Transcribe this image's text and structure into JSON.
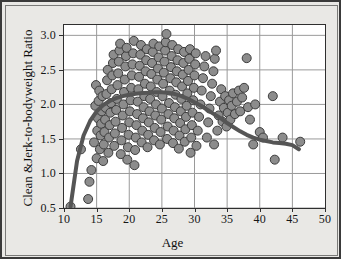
{
  "chart_data": {
    "type": "scatter",
    "title": "",
    "xlabel": "Age",
    "ylabel": "Clean &Jerk-to-bodyweight Ratio",
    "xlim": [
      10,
      50
    ],
    "ylim": [
      0.5,
      3.15
    ],
    "xticks": [
      "10",
      "15",
      "20",
      "25",
      "30",
      "35",
      "40",
      "45",
      "50"
    ],
    "yticks": [
      "0.5",
      "1.0",
      "1.5",
      "2.0",
      "2.5",
      "3.0"
    ],
    "grid": true,
    "legend": "none",
    "marker_color": "#8c8c8c",
    "marker_edge_color": "#3d3d3d",
    "marker_size": 9,
    "trend_color": "#555555",
    "trend_width": 4,
    "series": [
      {
        "name": "Lifters",
        "points": [
          [
            11.0,
            0.52
          ],
          [
            12.6,
            1.35
          ],
          [
            13.7,
            0.63
          ],
          [
            13.9,
            0.88
          ],
          [
            14.2,
            1.05
          ],
          [
            14.6,
            1.45
          ],
          [
            14.8,
            1.98
          ],
          [
            14.9,
            2.28
          ],
          [
            15.0,
            1.22
          ],
          [
            15.1,
            1.62
          ],
          [
            15.2,
            1.8
          ],
          [
            15.3,
            2.05
          ],
          [
            15.4,
            2.2
          ],
          [
            15.5,
            1.35
          ],
          [
            15.6,
            1.55
          ],
          [
            15.7,
            1.72
          ],
          [
            15.8,
            1.9
          ],
          [
            15.9,
            2.12
          ],
          [
            16.0,
            1.18
          ],
          [
            16.1,
            1.42
          ],
          [
            16.2,
            1.6
          ],
          [
            16.3,
            1.78
          ],
          [
            16.4,
            1.95
          ],
          [
            16.5,
            2.15
          ],
          [
            16.6,
            2.35
          ],
          [
            16.7,
            2.5
          ],
          [
            16.8,
            1.3
          ],
          [
            16.9,
            1.52
          ],
          [
            17.0,
            1.7
          ],
          [
            17.1,
            1.88
          ],
          [
            17.2,
            2.02
          ],
          [
            17.3,
            2.22
          ],
          [
            17.4,
            2.42
          ],
          [
            17.5,
            2.6
          ],
          [
            17.6,
            2.72
          ],
          [
            17.7,
            1.4
          ],
          [
            17.8,
            1.58
          ],
          [
            17.9,
            1.75
          ],
          [
            18.0,
            1.92
          ],
          [
            18.1,
            2.08
          ],
          [
            18.2,
            2.28
          ],
          [
            18.3,
            2.45
          ],
          [
            18.4,
            2.62
          ],
          [
            18.5,
            2.78
          ],
          [
            18.6,
            2.88
          ],
          [
            18.7,
            1.28
          ],
          [
            18.8,
            1.48
          ],
          [
            18.9,
            1.66
          ],
          [
            19.0,
            1.84
          ],
          [
            19.1,
            2.0
          ],
          [
            19.2,
            2.18
          ],
          [
            19.3,
            2.36
          ],
          [
            19.4,
            2.55
          ],
          [
            19.5,
            2.7
          ],
          [
            19.6,
            2.82
          ],
          [
            19.7,
            1.2
          ],
          [
            19.8,
            1.38
          ],
          [
            19.9,
            1.56
          ],
          [
            20.0,
            1.74
          ],
          [
            20.1,
            1.9
          ],
          [
            20.2,
            2.06
          ],
          [
            20.3,
            2.24
          ],
          [
            20.4,
            2.42
          ],
          [
            20.5,
            2.58
          ],
          [
            20.6,
            2.74
          ],
          [
            20.7,
            2.92
          ],
          [
            20.8,
            1.12
          ],
          [
            20.9,
            1.34
          ],
          [
            21.0,
            1.52
          ],
          [
            21.1,
            1.7
          ],
          [
            21.2,
            1.86
          ],
          [
            21.3,
            2.04
          ],
          [
            21.4,
            2.22
          ],
          [
            21.5,
            2.4
          ],
          [
            21.6,
            2.56
          ],
          [
            21.7,
            2.72
          ],
          [
            21.8,
            2.86
          ],
          [
            21.9,
            1.45
          ],
          [
            22.0,
            1.62
          ],
          [
            22.1,
            1.8
          ],
          [
            22.2,
            1.96
          ],
          [
            22.3,
            2.12
          ],
          [
            22.4,
            2.3
          ],
          [
            22.5,
            2.48
          ],
          [
            22.6,
            2.64
          ],
          [
            22.7,
            2.8
          ],
          [
            22.8,
            1.38
          ],
          [
            22.9,
            1.56
          ],
          [
            23.0,
            1.74
          ],
          [
            23.1,
            1.9
          ],
          [
            23.2,
            2.08
          ],
          [
            23.3,
            2.26
          ],
          [
            23.4,
            2.44
          ],
          [
            23.5,
            2.6
          ],
          [
            23.6,
            2.76
          ],
          [
            23.7,
            2.88
          ],
          [
            23.8,
            1.48
          ],
          [
            23.9,
            1.66
          ],
          [
            24.0,
            1.84
          ],
          [
            24.1,
            2.0
          ],
          [
            24.2,
            2.18
          ],
          [
            24.3,
            2.36
          ],
          [
            24.4,
            2.52
          ],
          [
            24.5,
            2.68
          ],
          [
            24.6,
            2.84
          ],
          [
            24.7,
            1.42
          ],
          [
            24.8,
            1.6
          ],
          [
            24.9,
            1.78
          ],
          [
            25.0,
            1.94
          ],
          [
            25.1,
            2.12
          ],
          [
            25.2,
            2.3
          ],
          [
            25.3,
            2.46
          ],
          [
            25.4,
            2.62
          ],
          [
            25.5,
            2.78
          ],
          [
            25.6,
            2.9
          ],
          [
            25.7,
            3.02
          ],
          [
            25.8,
            1.5
          ],
          [
            25.9,
            1.68
          ],
          [
            26.0,
            1.86
          ],
          [
            26.1,
            2.02
          ],
          [
            26.2,
            2.2
          ],
          [
            26.3,
            2.38
          ],
          [
            26.4,
            2.54
          ],
          [
            26.5,
            2.7
          ],
          [
            26.6,
            2.86
          ],
          [
            26.7,
            1.44
          ],
          [
            26.8,
            1.62
          ],
          [
            26.9,
            1.8
          ],
          [
            27.0,
            1.96
          ],
          [
            27.1,
            2.14
          ],
          [
            27.2,
            2.32
          ],
          [
            27.3,
            2.48
          ],
          [
            27.4,
            2.64
          ],
          [
            27.5,
            2.8
          ],
          [
            27.6,
            1.36
          ],
          [
            27.7,
            1.55
          ],
          [
            27.8,
            1.73
          ],
          [
            27.9,
            1.9
          ],
          [
            28.0,
            2.08
          ],
          [
            28.1,
            2.26
          ],
          [
            28.2,
            2.43
          ],
          [
            28.3,
            2.6
          ],
          [
            28.4,
            2.76
          ],
          [
            28.5,
            1.46
          ],
          [
            28.6,
            1.64
          ],
          [
            28.7,
            1.82
          ],
          [
            28.8,
            1.98
          ],
          [
            28.9,
            2.16
          ],
          [
            29.0,
            2.34
          ],
          [
            29.1,
            2.5
          ],
          [
            29.2,
            2.66
          ],
          [
            29.3,
            2.8
          ],
          [
            29.4,
            1.3
          ],
          [
            29.5,
            1.52
          ],
          [
            29.6,
            1.7
          ],
          [
            29.7,
            1.88
          ],
          [
            29.8,
            2.06
          ],
          [
            29.9,
            2.24
          ],
          [
            30.0,
            2.42
          ],
          [
            30.1,
            2.58
          ],
          [
            30.2,
            2.74
          ],
          [
            30.3,
            1.4
          ],
          [
            30.5,
            1.62
          ],
          [
            30.7,
            1.82
          ],
          [
            30.9,
            2.0
          ],
          [
            31.1,
            2.2
          ],
          [
            31.3,
            2.38
          ],
          [
            31.5,
            2.55
          ],
          [
            31.7,
            2.7
          ],
          [
            31.9,
            1.52
          ],
          [
            32.1,
            1.74
          ],
          [
            32.3,
            1.94
          ],
          [
            32.5,
            2.12
          ],
          [
            32.7,
            2.3
          ],
          [
            32.9,
            2.48
          ],
          [
            33.0,
            1.42
          ],
          [
            33.1,
            2.66
          ],
          [
            33.3,
            2.78
          ],
          [
            33.5,
            1.62
          ],
          [
            33.7,
            1.84
          ],
          [
            33.9,
            2.04
          ],
          [
            34.1,
            2.22
          ],
          [
            34.3,
            1.75
          ],
          [
            34.5,
            1.95
          ],
          [
            34.7,
            2.12
          ],
          [
            34.9,
            1.68
          ],
          [
            35.1,
            1.88
          ],
          [
            35.3,
            2.06
          ],
          [
            35.5,
            1.78
          ],
          [
            35.7,
            1.98
          ],
          [
            35.9,
            2.16
          ],
          [
            36.2,
            1.86
          ],
          [
            36.5,
            2.04
          ],
          [
            36.8,
            2.2
          ],
          [
            37.0,
            1.9
          ],
          [
            37.3,
            2.1
          ],
          [
            37.6,
            2.24
          ],
          [
            38.0,
            2.67
          ],
          [
            38.2,
            1.96
          ],
          [
            38.5,
            1.78
          ],
          [
            39.0,
            1.42
          ],
          [
            39.3,
            2.0
          ],
          [
            40.0,
            1.6
          ],
          [
            40.5,
            1.52
          ],
          [
            42.0,
            2.12
          ],
          [
            42.3,
            1.2
          ],
          [
            43.5,
            1.52
          ],
          [
            46.2,
            1.46
          ]
        ]
      }
    ],
    "trend": {
      "name": "Quadratic fit",
      "points": [
        [
          11.0,
          0.52
        ],
        [
          12.0,
          1.18
        ],
        [
          13.0,
          1.55
        ],
        [
          14.0,
          1.76
        ],
        [
          15.0,
          1.9
        ],
        [
          16.0,
          1.99
        ],
        [
          17.0,
          2.05
        ],
        [
          18.0,
          2.09
        ],
        [
          19.0,
          2.12
        ],
        [
          20.0,
          2.14
        ],
        [
          21.0,
          2.155
        ],
        [
          22.0,
          2.165
        ],
        [
          23.0,
          2.17
        ],
        [
          24.0,
          2.175
        ],
        [
          25.0,
          2.175
        ],
        [
          26.0,
          2.17
        ],
        [
          27.0,
          2.15
        ],
        [
          28.0,
          2.12
        ],
        [
          29.0,
          2.08
        ],
        [
          30.0,
          2.03
        ],
        [
          31.0,
          1.98
        ],
        [
          32.0,
          1.92
        ],
        [
          33.0,
          1.86
        ],
        [
          34.0,
          1.8
        ],
        [
          35.0,
          1.73
        ],
        [
          36.0,
          1.67
        ],
        [
          37.0,
          1.61
        ],
        [
          38.0,
          1.56
        ],
        [
          39.0,
          1.52
        ],
        [
          40.0,
          1.49
        ],
        [
          41.0,
          1.47
        ],
        [
          42.0,
          1.45
        ],
        [
          43.0,
          1.44
        ],
        [
          44.0,
          1.43
        ],
        [
          45.0,
          1.41
        ],
        [
          46.0,
          1.35
        ]
      ]
    }
  }
}
